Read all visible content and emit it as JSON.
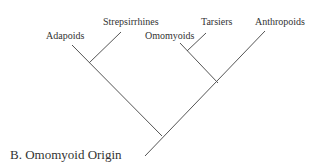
{
  "diagram": {
    "title": "B. Omomyoid Origin",
    "type": "cladogram",
    "taxa": [
      {
        "label": "Adapoids"
      },
      {
        "label": "Strepsirrhines"
      },
      {
        "label": "Omomyoids"
      },
      {
        "label": "Tarsiers"
      },
      {
        "label": "Anthropoids"
      }
    ],
    "topology": "((Adapoids, Strepsirrhines), ((Omomyoids, Tarsiers), Anthropoids))",
    "line_color": "#555555"
  }
}
